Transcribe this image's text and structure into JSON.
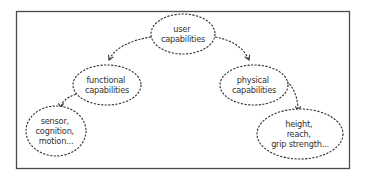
{
  "diagram": {
    "type": "tree",
    "style": {
      "border_color": "#4a4a4a",
      "stroke_color": "#2e2e2e",
      "text_color": "#333333",
      "background": "#ffffff",
      "line_style": "dashed"
    },
    "nodes": {
      "user": {
        "id": "user",
        "lines": [
          "user",
          "capabilities"
        ]
      },
      "functional": {
        "id": "functional",
        "lines": [
          "functional",
          "capabilities"
        ]
      },
      "physical": {
        "id": "physical",
        "lines": [
          "physical",
          "capabilities"
        ]
      },
      "functional_examples": {
        "id": "functional_examples",
        "lines": [
          "sensor,",
          "cognition,",
          "motion..."
        ]
      },
      "physical_examples": {
        "id": "physical_examples",
        "lines": [
          "height,",
          "reach,",
          "grip strength..."
        ]
      }
    },
    "edges": [
      {
        "from": "user",
        "to": "functional"
      },
      {
        "from": "user",
        "to": "physical"
      },
      {
        "from": "functional",
        "to": "functional_examples"
      },
      {
        "from": "physical",
        "to": "physical_examples"
      }
    ]
  }
}
